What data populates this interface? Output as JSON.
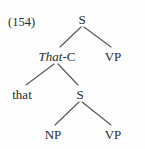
{
  "figure": {
    "example_number": "(154)",
    "type": "syntactic-tree-diagram",
    "colors": {
      "background": "#fdfdfd",
      "text": "#2b2b2b",
      "line": "#555555"
    }
  },
  "tree": {
    "nodes": [
      {
        "id": "root-s",
        "label": "S",
        "x": 82,
        "y": 19,
        "style": "normal"
      },
      {
        "id": "that-c",
        "label_italic": "That",
        "label_rest": "-C",
        "x": 57,
        "y": 56,
        "style": "mixed"
      },
      {
        "id": "vp-upper",
        "label": "VP",
        "x": 113,
        "y": 56,
        "style": "normal"
      },
      {
        "id": "that-leaf",
        "label": "that",
        "x": 22,
        "y": 94,
        "style": "normal"
      },
      {
        "id": "inner-s",
        "label": "S",
        "x": 80,
        "y": 94,
        "style": "normal"
      },
      {
        "id": "np-lower",
        "label": "NP",
        "x": 53,
        "y": 134,
        "style": "normal"
      },
      {
        "id": "vp-lower",
        "label": "VP",
        "x": 113,
        "y": 134,
        "style": "normal"
      }
    ],
    "edges": [
      {
        "id": "edge-root-to-thatc",
        "from": "root-s",
        "to": "that-c",
        "x1": 81,
        "y1": 27,
        "x2": 60,
        "y2": 47
      },
      {
        "id": "edge-root-to-vp",
        "from": "root-s",
        "to": "vp-upper",
        "x1": 84,
        "y1": 27,
        "x2": 111,
        "y2": 47
      },
      {
        "id": "edge-thatc-to-that",
        "from": "that-c",
        "to": "that-leaf",
        "x1": 54,
        "y1": 64,
        "x2": 26,
        "y2": 85
      },
      {
        "id": "edge-thatc-to-s",
        "from": "that-c",
        "to": "inner-s",
        "x1": 58,
        "y1": 64,
        "x2": 78,
        "y2": 85
      },
      {
        "id": "edge-s-to-np",
        "from": "inner-s",
        "to": "np-lower",
        "x1": 79,
        "y1": 102,
        "x2": 55,
        "y2": 125
      },
      {
        "id": "edge-s-to-vp",
        "from": "inner-s",
        "to": "vp-lower",
        "x1": 82,
        "y1": 102,
        "x2": 111,
        "y2": 125
      }
    ]
  }
}
